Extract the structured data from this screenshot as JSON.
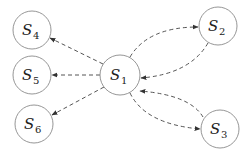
{
  "diagram": {
    "type": "directed-graph",
    "edge_style": "dashed",
    "nodes": [
      {
        "id": "S1",
        "letter": "S",
        "sub": "1",
        "cx": 120,
        "cy": 75,
        "r": 20
      },
      {
        "id": "S2",
        "letter": "S",
        "sub": "2",
        "cx": 218,
        "cy": 26,
        "r": 19
      },
      {
        "id": "S3",
        "letter": "S",
        "sub": "3",
        "cx": 220,
        "cy": 129,
        "r": 19
      },
      {
        "id": "S4",
        "letter": "S",
        "sub": "4",
        "cx": 32,
        "cy": 30,
        "r": 19
      },
      {
        "id": "S5",
        "letter": "S",
        "sub": "5",
        "cx": 32,
        "cy": 75,
        "r": 19
      },
      {
        "id": "S6",
        "letter": "S",
        "sub": "6",
        "cx": 34,
        "cy": 124,
        "r": 19
      }
    ],
    "edges": [
      {
        "from": "S1",
        "to": "S4",
        "shape": "straight"
      },
      {
        "from": "S1",
        "to": "S5",
        "shape": "straight"
      },
      {
        "from": "S1",
        "to": "S6",
        "shape": "straight"
      },
      {
        "from": "S1",
        "to": "S2",
        "shape": "curved"
      },
      {
        "from": "S2",
        "to": "S1",
        "shape": "curved"
      },
      {
        "from": "S1",
        "to": "S3",
        "shape": "curved"
      },
      {
        "from": "S3",
        "to": "S1",
        "shape": "curved"
      }
    ],
    "colors": {
      "edge": "#555555",
      "node_stroke": "#8a8a8a",
      "text": "#222222"
    }
  }
}
